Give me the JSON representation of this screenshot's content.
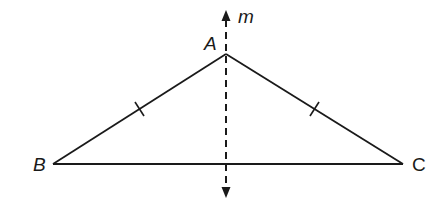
{
  "diagram": {
    "type": "isosceles-triangle-with-line-of-symmetry",
    "colors": {
      "stroke": "#1a1a1a",
      "background": "#ffffff"
    },
    "vertices": {
      "A": {
        "label": "A",
        "x": 226,
        "y": 54
      },
      "B": {
        "label": "B",
        "x": 53,
        "y": 164
      },
      "C": {
        "label": "C",
        "x": 403,
        "y": 164
      }
    },
    "segments": [
      {
        "from": "A",
        "to": "B",
        "tick_marks": 1
      },
      {
        "from": "A",
        "to": "C",
        "tick_marks": 1
      },
      {
        "from": "B",
        "to": "C",
        "tick_marks": 0
      }
    ],
    "line": {
      "label": "m",
      "style": "dashed",
      "x": 226,
      "y_top": 13,
      "y_bottom": 196,
      "arrows": [
        "up",
        "down"
      ]
    }
  }
}
